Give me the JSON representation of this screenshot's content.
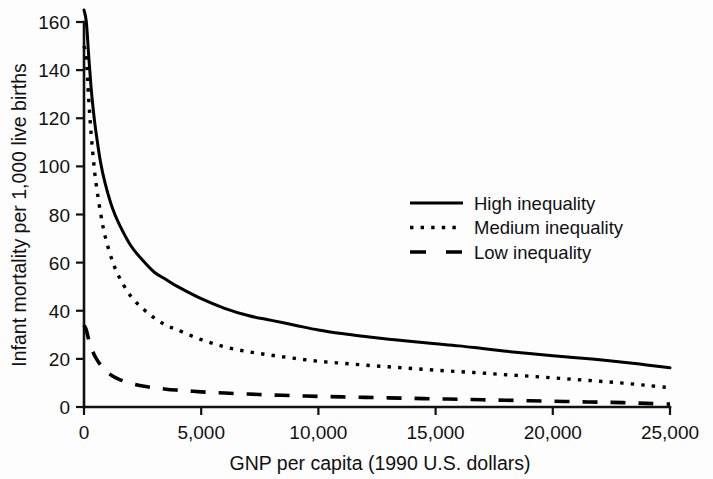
{
  "chart_data": {
    "type": "line",
    "title": "",
    "subtitle": "",
    "xlabel": "GNP per capita (1990 U.S. dollars)",
    "ylabel": "Infant mortality per 1,000 live births",
    "xlim": [
      0,
      25000
    ],
    "ylim": [
      0,
      160
    ],
    "grid": false,
    "legend_position": "center-right",
    "xticks": [
      0,
      5000,
      10000,
      15000,
      20000,
      25000
    ],
    "xtick_labels": [
      "0",
      "5,000",
      "10,000",
      "15,000",
      "20,000",
      "25,000"
    ],
    "yticks": [
      0,
      20,
      40,
      60,
      80,
      100,
      120,
      140,
      160
    ],
    "ytick_labels": [
      "0",
      "20",
      "40",
      "60",
      "80",
      "100",
      "120",
      "140",
      "160"
    ],
    "x": [
      0,
      100,
      200,
      300,
      400,
      500,
      700,
      900,
      1200,
      1500,
      2000,
      2500,
      3000,
      3500,
      4000,
      5000,
      6000,
      7000,
      8000,
      9000,
      10000,
      11000,
      12000,
      13000,
      14000,
      15000,
      16000,
      17000,
      18000,
      19000,
      20000,
      21000,
      22000,
      23000,
      24000,
      25000
    ],
    "series": [
      {
        "name": "High inequality",
        "style": "solid",
        "values": [
          165,
          160,
          146,
          133,
          123,
          115,
          102,
          93,
          83,
          76,
          67,
          61,
          56,
          53,
          50,
          45,
          41,
          38,
          36,
          34,
          32,
          30.5,
          29.3,
          28.2,
          27.2,
          26.3,
          25.4,
          24.3,
          23.2,
          22.2,
          21.3,
          20.5,
          19.6,
          18.6,
          17.5,
          16.3
        ]
      },
      {
        "name": "Medium inequality",
        "style": "dotted",
        "values": [
          150,
          145,
          128,
          114,
          103,
          94,
          81,
          71,
          61,
          54,
          46,
          41,
          37,
          34,
          32,
          28,
          25,
          23,
          21.5,
          20.2,
          19,
          18.2,
          17.4,
          16.7,
          16,
          15.3,
          14.7,
          14.1,
          13.4,
          12.8,
          12.1,
          11.4,
          10.7,
          9.9,
          9,
          8.0
        ]
      },
      {
        "name": "Low inequality",
        "style": "dashed",
        "values": [
          34,
          32,
          28,
          25,
          22.5,
          20.5,
          17.5,
          15.3,
          13,
          11.5,
          9.8,
          8.7,
          8,
          7.4,
          7.0,
          6.3,
          5.8,
          5.4,
          5.0,
          4.7,
          4.4,
          4.2,
          4.0,
          3.8,
          3.6,
          3.4,
          3.2,
          3.0,
          2.8,
          2.6,
          2.4,
          2.2,
          2.0,
          1.8,
          1.5,
          1.2
        ]
      }
    ],
    "colors": {
      "line": "#000000",
      "axis": "#111111",
      "text": "#111111",
      "background": "#fdfdfd"
    }
  },
  "legend": {
    "entries": [
      {
        "label": "High inequality",
        "style": "solid"
      },
      {
        "label": "Medium inequality",
        "style": "dotted"
      },
      {
        "label": "Low inequality",
        "style": "dashed"
      }
    ]
  }
}
